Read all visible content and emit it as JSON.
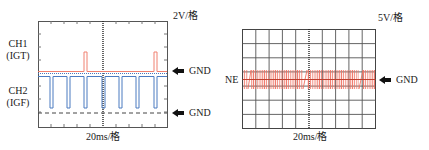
{
  "left_scope": {
    "volt_div": "2V/格",
    "time_div": "20ms/格",
    "ch1": {
      "name": "CH1",
      "signal": "(IGT)",
      "color": "#f08070"
    },
    "ch2": {
      "name": "CH2",
      "signal": "(IGF)",
      "color": "#4a7ac0"
    },
    "gnd1_label": "GND",
    "gnd2_label": "GND"
  },
  "right_scope": {
    "volt_div": "5V/格",
    "time_div": "20ms/格",
    "signal_label": "NE",
    "signal_color": "#f07060",
    "gnd_label": "GND",
    "grid": {
      "cols": 10,
      "rows": 7
    }
  }
}
